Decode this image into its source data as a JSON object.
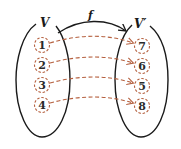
{
  "diagram": {
    "type": "mapping",
    "colors": {
      "outline": "#1a1a1a",
      "dashed": "#b5603f",
      "text": "#2a2a2a"
    },
    "domain_set": {
      "label": "V",
      "elements": [
        "1",
        "2",
        "3",
        "4"
      ]
    },
    "codomain_set": {
      "label": "V′",
      "elements": [
        "7",
        "6",
        "5",
        "8"
      ]
    },
    "mapping": {
      "label": "f",
      "pairs": [
        {
          "from": "1",
          "to": "7"
        },
        {
          "from": "2",
          "to": "6"
        },
        {
          "from": "3",
          "to": "5"
        },
        {
          "from": "4",
          "to": "8"
        }
      ]
    }
  }
}
